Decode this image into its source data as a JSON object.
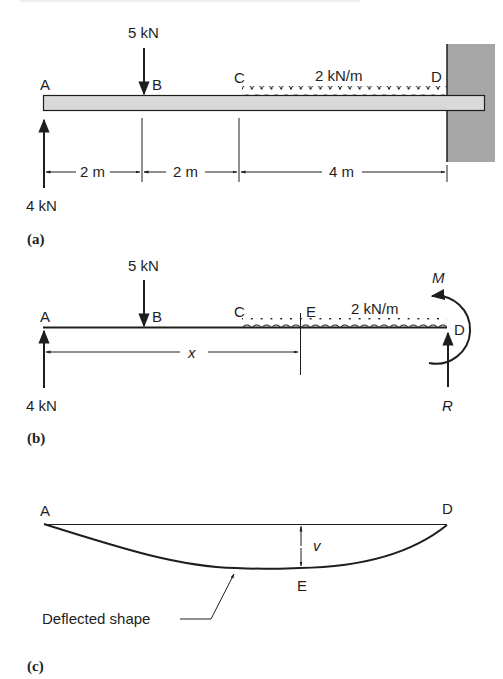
{
  "panel_a": {
    "caption": "(a)",
    "points": {
      "A": "A",
      "B": "B",
      "C": "C",
      "D": "D"
    },
    "point_load": "5 kN",
    "reaction_A": "4 kN",
    "distributed_load": "2 kN/m",
    "dimensions": [
      "2 m",
      "2 m",
      "4 m"
    ]
  },
  "panel_b": {
    "caption": "(b)",
    "points": {
      "A": "A",
      "B": "B",
      "C": "C",
      "D": "D",
      "E": "E"
    },
    "point_load": "5 kN",
    "reaction_A": "4 kN",
    "distributed_load": "2 kN/m",
    "distance_label": "x",
    "moment_label": "M",
    "reaction_label": "R"
  },
  "panel_c": {
    "caption": "(c)",
    "points": {
      "A": "A",
      "D": "D",
      "E": "E"
    },
    "deflection_label": "v",
    "callout": "Deflected shape"
  },
  "colors": {
    "ink": "#1e1e1e",
    "beam_fill": "#d9d9d9",
    "wall_fill": "#a6a6a6"
  }
}
